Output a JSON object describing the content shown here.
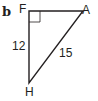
{
  "figure": {
    "part_label": "b",
    "vertices": {
      "F": {
        "label": "F",
        "x": 29,
        "y": 11
      },
      "A": {
        "label": "A",
        "x": 83,
        "y": 11
      },
      "H": {
        "label": "H",
        "x": 29,
        "y": 83
      }
    },
    "right_angle_at": "F",
    "sides": {
      "FH": {
        "label": "12"
      },
      "HA": {
        "label": "15"
      },
      "FA": {
        "label": ""
      }
    },
    "stroke_color": "#231f20"
  }
}
